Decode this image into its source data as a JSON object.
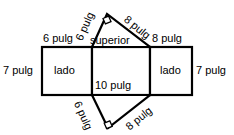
{
  "diagram": {
    "unit": "pulg",
    "stroke_color": "#000000",
    "fill_color": "#ffffff",
    "faces": {
      "left_rect_label": "lado",
      "right_rect_label": "lado",
      "middle_rect_label": "superior"
    },
    "labels": {
      "left_outer_height": "7 pulg",
      "right_outer_height": "7 pulg",
      "left_top_width": "6 pulg",
      "right_top_width": "8 pulg",
      "middle_bottom_width": "10 pulg",
      "top_tri_left_leg": "6 pulg",
      "top_tri_right_leg": "8 pulg",
      "bottom_tri_left_leg": "6 pulg",
      "bottom_tri_right_leg": "8 pulg"
    },
    "markers": {
      "top_right_angle": "right-angle-square",
      "bottom_right_angle": "right-angle-square"
    }
  }
}
